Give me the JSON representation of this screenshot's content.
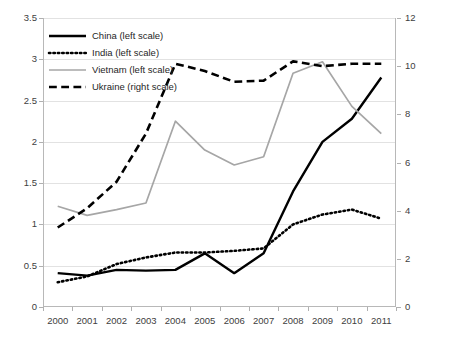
{
  "chart_data": {
    "type": "line",
    "title": "",
    "subtitle": "",
    "xlabel": "",
    "ylabel": "",
    "y2label": "",
    "grid": true,
    "legend_position": "top-left",
    "categories": [
      "2000",
      "2001",
      "2002",
      "2003",
      "2004",
      "2005",
      "2006",
      "2007",
      "2008",
      "2009",
      "2010",
      "2011"
    ],
    "xtick_labels": [
      "2000",
      "2001",
      "2002",
      "2003",
      "2004",
      "2005",
      "2006",
      "2007",
      "2008",
      "2009",
      "2010",
      "2011"
    ],
    "ylim": [
      0,
      3.5
    ],
    "ytick_labels": [
      "0",
      "0.5",
      "1",
      "1.5",
      "2",
      "2.5",
      "3",
      "3.5"
    ],
    "ytick_values": [
      0,
      0.5,
      1,
      1.5,
      2,
      2.5,
      3,
      3.5
    ],
    "y2lim": [
      0,
      12
    ],
    "y2tick_labels": [
      "0",
      "2",
      "4",
      "6",
      "8",
      "10",
      "12"
    ],
    "y2tick_values": [
      0,
      2,
      4,
      6,
      8,
      10,
      12
    ],
    "series": [
      {
        "name": "China (left scale)",
        "axis": "left",
        "style": "solid",
        "color": "#000000",
        "width": 2.4,
        "values": [
          0.41,
          0.38,
          0.45,
          0.44,
          0.45,
          0.65,
          0.41,
          0.65,
          1.4,
          2.0,
          2.28,
          2.78
        ]
      },
      {
        "name": "India (left scale)",
        "axis": "left",
        "style": "dotted",
        "color": "#000000",
        "width": 2.6,
        "values": [
          0.3,
          0.37,
          0.52,
          0.6,
          0.66,
          0.66,
          0.68,
          0.71,
          1.0,
          1.12,
          1.18,
          1.07
        ]
      },
      {
        "name": "Vietnam (left scale)",
        "axis": "left",
        "style": "solid",
        "color": "#a6a6a6",
        "width": 1.7,
        "values": [
          1.22,
          1.11,
          1.18,
          1.26,
          2.25,
          1.9,
          1.72,
          1.82,
          2.83,
          2.97,
          2.43,
          2.1
        ]
      },
      {
        "name": "Ukraine (right scale)",
        "axis": "right",
        "style": "dashed",
        "color": "#000000",
        "width": 2.6,
        "values": [
          3.3,
          4.1,
          5.2,
          7.2,
          10.1,
          9.8,
          9.35,
          9.4,
          10.2,
          10.0,
          10.1,
          10.1
        ]
      }
    ]
  },
  "legend": {
    "items": [
      {
        "label": "China (left scale)",
        "swatch": "solid-black-line"
      },
      {
        "label": "India (left scale)",
        "swatch": "dotted-black-line"
      },
      {
        "label": "Vietnam (left scale)",
        "swatch": "solid-gray-line"
      },
      {
        "label": "Ukraine (right scale)",
        "swatch": "dashed-black-line"
      }
    ]
  },
  "colors": {
    "china": "#000000",
    "india": "#000000",
    "vietnam": "#a6a6a6",
    "ukraine": "#000000",
    "gridline": "#e2e2e2",
    "axis": "#b8b8b8",
    "text": "#404040",
    "background": "#ffffff"
  }
}
